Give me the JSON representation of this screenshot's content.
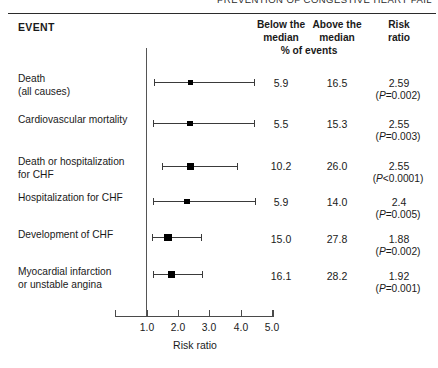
{
  "figure": {
    "running_head": "PREVENTION OF CONGESTIVE HEART FAIL",
    "event_header": "EVENT",
    "columns": {
      "below_median": "Below the\nmedian",
      "above_median": "Above the\nmedian",
      "risk_ratio": "Risk\nratio",
      "pct_of_events": "% of events"
    }
  },
  "chart_data": {
    "type": "scatter",
    "title": "",
    "xlabel": "Risk ratio",
    "ylabel": "",
    "xlim": [
      0.6,
      5.1
    ],
    "xticks": [
      1.0,
      2.0,
      3.0,
      4.0,
      5.0
    ],
    "xticklabels": [
      "1.0",
      "2.0",
      "3.0",
      "4.0",
      "5.0"
    ],
    "reference_line": 1.0,
    "grid": false,
    "legend": null,
    "categories": [
      "Death (all causes)",
      "Cardiovascular mortality",
      "Death or hospitalization for CHF",
      "Hospitalization for CHF",
      "Development of CHF",
      "Myocardial infarction or unstable angina"
    ],
    "series": [
      {
        "name": "Risk ratio",
        "values": [
          2.59,
          2.55,
          2.55,
          2.4,
          1.88,
          1.92
        ]
      },
      {
        "name": "CI lower",
        "values": [
          1.25,
          1.22,
          1.52,
          1.22,
          1.18,
          1.23
        ]
      },
      {
        "name": "CI upper",
        "values": [
          4.48,
          4.48,
          3.93,
          4.52,
          2.75,
          2.8
        ]
      },
      {
        "name": "% events below median",
        "values": [
          5.9,
          5.5,
          10.2,
          5.9,
          15.0,
          16.1
        ]
      },
      {
        "name": "% events above median",
        "values": [
          16.5,
          15.3,
          26.0,
          14.0,
          27.8,
          28.2
        ]
      }
    ]
  },
  "rows": [
    {
      "label": "Death\n(all causes)",
      "below_median": "5.9",
      "above_median": "16.5",
      "risk_ratio": "2.59",
      "p_prefix": "(",
      "p_italic": "P",
      "p_suffix": "=0.002)"
    },
    {
      "label": "Cardiovascular mortality",
      "below_median": "5.5",
      "above_median": "15.3",
      "risk_ratio": "2.55",
      "p_prefix": "(",
      "p_italic": "P",
      "p_suffix": "=0.003)"
    },
    {
      "label": "Death or hospitalization\nfor CHF",
      "below_median": "10.2",
      "above_median": "26.0",
      "risk_ratio": "2.55",
      "p_prefix": "(",
      "p_italic": "P",
      "p_suffix": "<0.0001)"
    },
    {
      "label": "Hospitalization for CHF",
      "below_median": "5.9",
      "above_median": "14.0",
      "risk_ratio": "2.4",
      "p_prefix": "(",
      "p_italic": "P",
      "p_suffix": "=0.005)"
    },
    {
      "label": "Development of CHF",
      "below_median": "15.0",
      "above_median": "27.8",
      "risk_ratio": "1.88",
      "p_prefix": "(",
      "p_italic": "P",
      "p_suffix": "=0.002)"
    },
    {
      "label": "Myocardial infarction\nor unstable angina",
      "below_median": "16.1",
      "above_median": "28.2",
      "risk_ratio": "1.92",
      "p_prefix": "(",
      "p_italic": "P",
      "p_suffix": "=0.001)"
    }
  ],
  "axis": {
    "title": "Risk ratio",
    "ticks": [
      "1.0",
      "2.0",
      "3.0",
      "4.0",
      "5.0"
    ]
  },
  "geometry": {
    "row_tops": [
      72,
      113,
      155,
      191,
      228,
      265
    ],
    "bar_y": [
      82,
      123,
      166,
      201,
      237,
      274
    ],
    "marker_sizes": [
      5,
      5.5,
      7,
      5.5,
      7.5,
      7
    ],
    "ci_px": [
      {
        "left": 154,
        "mid": 190,
        "right": 254
      },
      {
        "left": 153,
        "mid": 190,
        "right": 254
      },
      {
        "left": 162,
        "mid": 190,
        "right": 237
      },
      {
        "left": 153,
        "mid": 187,
        "right": 255
      },
      {
        "left": 152,
        "mid": 168,
        "right": 201
      },
      {
        "left": 153,
        "mid": 171,
        "right": 202
      }
    ],
    "tick_px": [
      147,
      178,
      209,
      241,
      272
    ],
    "value_tops": [
      77,
      118,
      160,
      196,
      233,
      270
    ],
    "p_tops": [
      90,
      131,
      173,
      209,
      246,
      283
    ]
  },
  "colors": {
    "ink": "#1a1a1a",
    "rule": "#2b2b2b",
    "line": "#3a3a3a",
    "marker": "#000000",
    "background": "#ffffff"
  }
}
